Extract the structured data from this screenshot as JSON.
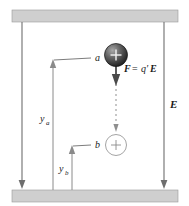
{
  "figure": {
    "colors": {
      "plate_fill": "#cfcfcf",
      "plate_stroke": "#9a9a9a",
      "field_line": "#6e6e6e",
      "dimension_line": "#8a8a8a",
      "force_arrow": "#4a4a4a",
      "trail": "#8f8f8f",
      "background": "#ffffff",
      "text": "#1a1a1a"
    },
    "labels": {
      "point_a": "a",
      "point_b": "b",
      "force": "F = q′E",
      "force_symbol": "F",
      "force_equals": "=",
      "force_charge": "q′",
      "force_field": "E",
      "field": "E",
      "height_a_symbol": "y",
      "height_a_subscript": "a",
      "height_b_symbol": "y",
      "height_b_subscript": "b",
      "charge_sign": "+"
    }
  }
}
